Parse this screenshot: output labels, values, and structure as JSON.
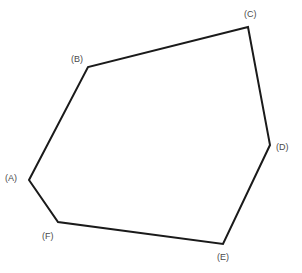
{
  "figure": {
    "type": "polygon-diagram",
    "shape_name": "hexagon",
    "canvas": {
      "width": 302,
      "height": 273,
      "background": "#ffffff"
    },
    "stroke": {
      "color": "#1a1a1a",
      "width": 2.0,
      "join": "miter",
      "fill": "none"
    },
    "label_style": {
      "color": "#4a4a4a",
      "font_size_px": 9
    },
    "vertices": [
      {
        "id": "A",
        "label": "(A)",
        "x": 29,
        "y": 180,
        "label_x": 5,
        "label_y": 173
      },
      {
        "id": "B",
        "label": "(B)",
        "x": 88,
        "y": 67,
        "label_x": 71,
        "label_y": 54
      },
      {
        "id": "C",
        "label": "(C)",
        "x": 248,
        "y": 27,
        "label_x": 244,
        "label_y": 9
      },
      {
        "id": "D",
        "label": "(D)",
        "x": 270,
        "y": 145,
        "label_x": 276,
        "label_y": 142
      },
      {
        "id": "E",
        "label": "(E)",
        "x": 223,
        "y": 244,
        "label_x": 217,
        "label_y": 252
      },
      {
        "id": "F",
        "label": "(F)",
        "x": 58,
        "y": 222,
        "label_x": 42,
        "label_y": 231
      }
    ],
    "edges": [
      {
        "from": "A",
        "to": "B"
      },
      {
        "from": "B",
        "to": "C"
      },
      {
        "from": "C",
        "to": "D"
      },
      {
        "from": "D",
        "to": "E"
      },
      {
        "from": "E",
        "to": "F"
      },
      {
        "from": "F",
        "to": "A"
      }
    ]
  }
}
